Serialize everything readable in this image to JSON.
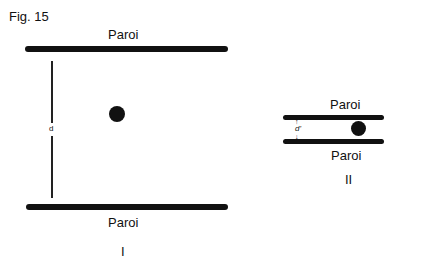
{
  "figure": {
    "title": "Fig. 15",
    "panel_I": {
      "top_wall_label": "Paroi",
      "bottom_wall_label": "Paroi",
      "distance_label": "d",
      "caption": "I"
    },
    "panel_II": {
      "top_wall_label": "Paroi",
      "bottom_wall_label": "Paroi",
      "distance_label": "d'",
      "caption": "II"
    }
  }
}
